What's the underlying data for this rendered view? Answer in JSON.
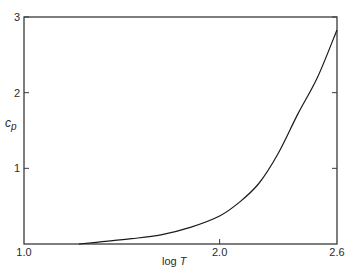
{
  "chart_data": {
    "type": "line",
    "title": "",
    "xlabel": "log T",
    "ylabel": "c_p",
    "ylabel_main": "c",
    "ylabel_sub": "p",
    "xlim": [
      1.0,
      2.6
    ],
    "ylim": [
      0,
      3
    ],
    "x_ticks": [
      {
        "value": 1.0,
        "label": "1.0"
      },
      {
        "value": 2.0,
        "label": "2.0"
      },
      {
        "value": 2.6,
        "label": "2.6"
      }
    ],
    "y_ticks": [
      {
        "value": 1,
        "label": "1"
      },
      {
        "value": 2,
        "label": "2"
      },
      {
        "value": 3,
        "label": "3"
      }
    ],
    "grid": false,
    "legend": null,
    "series": [
      {
        "name": "c_p",
        "color": "#1a1a1a",
        "x": [
          1.28,
          1.4,
          1.55,
          1.7,
          1.85,
          2.0,
          2.1,
          2.2,
          2.3,
          2.4,
          2.5,
          2.6
        ],
        "y": [
          0.0,
          0.03,
          0.07,
          0.12,
          0.22,
          0.37,
          0.55,
          0.8,
          1.2,
          1.72,
          2.2,
          2.83
        ]
      }
    ]
  },
  "colors": {
    "axis": "#3a3a3a",
    "line": "#1a1a1a",
    "background": "#ffffff"
  }
}
